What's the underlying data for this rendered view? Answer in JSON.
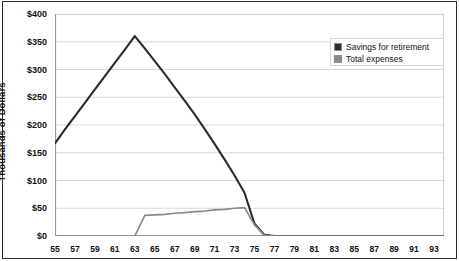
{
  "chart_data": {
    "type": "line",
    "title": "",
    "xlabel": "",
    "ylabel": "Thousands of Dollars",
    "xlim": [
      55,
      94
    ],
    "ylim": [
      0,
      400
    ],
    "ytick_values": [
      0,
      50,
      100,
      150,
      200,
      250,
      300,
      350,
      400
    ],
    "ytick_labels": [
      "$0",
      "$50",
      "$100",
      "$150",
      "$200",
      "$250",
      "$300",
      "$350",
      "$400"
    ],
    "xtick_labels": [
      "55",
      "57",
      "59",
      "61",
      "63",
      "65",
      "67",
      "69",
      "71",
      "73",
      "75",
      "77",
      "79",
      "81",
      "83",
      "85",
      "87",
      "89",
      "91",
      "93"
    ],
    "xtick_step": 1,
    "xlabel_step": 2,
    "grid": "horizontal",
    "legend_position": "upper-right",
    "x": [
      55,
      56,
      57,
      58,
      59,
      60,
      61,
      62,
      63,
      64,
      65,
      66,
      67,
      68,
      69,
      70,
      71,
      72,
      73,
      74,
      75,
      76,
      77,
      78,
      79,
      80,
      81,
      82,
      83,
      84,
      85,
      86,
      87,
      88,
      89,
      90,
      91,
      92,
      93,
      94
    ],
    "series": [
      {
        "name": "Savings for retirement",
        "color": "#2b2b2b",
        "values": [
          167,
          192,
          216,
          240,
          264,
          288,
          312,
          336,
          360,
          338,
          315,
          292,
          268,
          244,
          219,
          193,
          166,
          138,
          109,
          78,
          22,
          2,
          0,
          0,
          0,
          0,
          0,
          0,
          0,
          0,
          0,
          0,
          0,
          0,
          0,
          0,
          0,
          0,
          0,
          0
        ]
      },
      {
        "name": "Total expenses",
        "color": "#8a8a8a",
        "values": [
          0,
          0,
          0,
          0,
          0,
          0,
          0,
          0,
          0,
          37,
          38,
          39,
          41,
          42,
          44,
          45,
          47,
          48,
          50,
          51,
          20,
          1,
          0,
          0,
          0,
          0,
          0,
          0,
          0,
          0,
          0,
          0,
          0,
          0,
          0,
          0,
          0,
          0,
          0,
          0
        ]
      }
    ]
  },
  "legend": {
    "items": [
      {
        "label": "Savings for retirement",
        "color": "#2b2b2b"
      },
      {
        "label": "Total expenses",
        "color": "#8a8a8a"
      }
    ]
  },
  "colors": {
    "savings": "#2b2b2b",
    "expenses": "#8a8a8a",
    "grid": "#cfcfcf",
    "axis": "#9a9a9a",
    "frame": "#2b2b2b",
    "text": "#111111"
  }
}
